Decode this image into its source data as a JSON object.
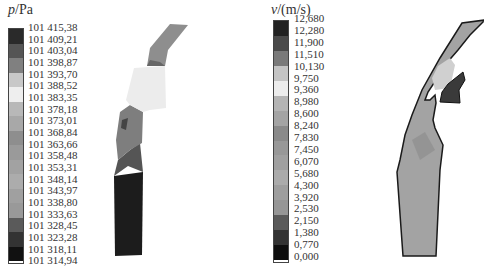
{
  "panels": [
    {
      "id": "pressure",
      "legend": {
        "symbol": "p",
        "unit": "/Pa",
        "labels": [
          "101 415,38",
          "101 409,21",
          "101 403,04",
          "101 398,87",
          "101 393,70",
          "101 388,52",
          "101 383,35",
          "101 378,18",
          "101 373,01",
          "101 368,84",
          "101 363,66",
          "101 358,48",
          "101 353,31",
          "101 348,14",
          "101 343,97",
          "101 338,80",
          "101 333,63",
          "101 328,45",
          "101 323,28",
          "101 318,11",
          "101 314,94"
        ],
        "colors": [
          "#2a2a2a",
          "#555555",
          "#808080",
          "#c8c8c8",
          "#eeeeee",
          "#b8b8b8",
          "#a8a8a8",
          "#8e8e8e",
          "#9a9a9a",
          "#a2a2a2",
          "#acacac",
          "#a0a0a0",
          "#999999",
          "#5a5a5a",
          "#333333",
          "#111111"
        ]
      }
    },
    {
      "id": "velocity",
      "legend": {
        "symbol": "v",
        "unit": "/(m/s)",
        "labels": [
          "12,680",
          "12,280",
          "11,900",
          "11,510",
          "10,130",
          "9,750",
          "9,360",
          "8,980",
          "8,600",
          "8,240",
          "7,830",
          "7,450",
          "6,070",
          "5,680",
          "4,300",
          "3,920",
          "2,530",
          "2,150",
          "1,380",
          "0,770",
          "0,000"
        ],
        "colors": [
          "#222222",
          "#4a4a4a",
          "#7a7a7a",
          "#c4c4c4",
          "#ececec",
          "#b4b4b4",
          "#a4a4a4",
          "#8a8a8a",
          "#989898",
          "#a0a0a0",
          "#ababab",
          "#9e9e9e",
          "#969696",
          "#5a5a5a",
          "#333333",
          "#0e0e0e"
        ]
      }
    }
  ]
}
